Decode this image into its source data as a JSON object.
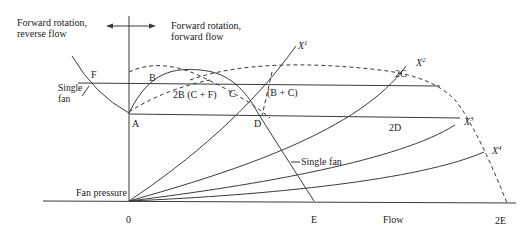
{
  "diagram": {
    "region_labels": {
      "left": [
        "Forward rotation,",
        "reverse flow"
      ],
      "right": [
        "Forward rotation,",
        "forward flow"
      ]
    },
    "axes": {
      "y_label": "Fan pressure",
      "x_label": "Flow",
      "origin_label": "0"
    },
    "points": {
      "F": "F",
      "B": "B",
      "C": "C",
      "A": "A",
      "D": "D",
      "E": "E",
      "two_B": "2B (C + F)",
      "B_plus_C": "(B + C)",
      "two_C": "2C",
      "two_D": "2D",
      "two_E": "2E"
    },
    "curve_labels": {
      "single_fan_left": [
        "Single",
        "fan"
      ],
      "single_fan_right": "Single fan"
    },
    "system_curves": [
      {
        "base": "X",
        "sup": "1"
      },
      {
        "base": "X",
        "sup": "2"
      },
      {
        "base": "X",
        "sup": "3"
      },
      {
        "base": "X",
        "sup": "4"
      }
    ],
    "colors": {
      "line": "#3a3a3a",
      "text": "#222222",
      "background": "#ffffff"
    }
  }
}
